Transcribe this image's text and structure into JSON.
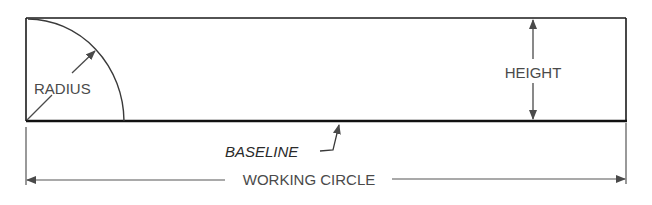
{
  "diagram": {
    "labels": {
      "radius": "RADIUS",
      "height": "HEIGHT",
      "baseline": "BASELINE",
      "working_circle": "WORKING CIRCLE"
    },
    "colors": {
      "outline": "#1a1a1a",
      "dimension": "#555555",
      "text": "#4a4a4a"
    }
  }
}
